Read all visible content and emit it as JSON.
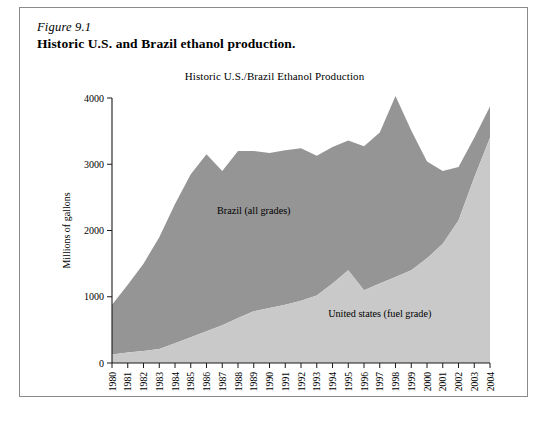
{
  "figure": {
    "number": "Figure 9.1",
    "caption": "Historic U.S. and Brazil ethanol production."
  },
  "chart_data": {
    "type": "area",
    "stacked": true,
    "title": "Historic U.S./Brazil Ethanol Production",
    "xlabel": "",
    "ylabel": "Millions of gallons",
    "ylim": [
      0,
      4000
    ],
    "yticks": [
      0,
      1000,
      2000,
      3000,
      4000
    ],
    "grid": false,
    "legend_position": "inline-annotation",
    "categories": [
      "1980",
      "1981",
      "1982",
      "1983",
      "1984",
      "1985",
      "1986",
      "1987",
      "1988",
      "1989",
      "1990",
      "1991",
      "1992",
      "1993",
      "1994",
      "1995",
      "1996",
      "1997",
      "1998",
      "1999",
      "2000",
      "2001",
      "2002",
      "2003",
      "2004"
    ],
    "series": [
      {
        "name": "United states (fuel grade)",
        "color": "#c9c9c9",
        "values": [
          130,
          160,
          180,
          210,
          300,
          390,
          480,
          570,
          680,
          780,
          830,
          880,
          940,
          1020,
          1200,
          1400,
          1100,
          1200,
          1300,
          1400,
          1580,
          1800,
          2150,
          2800,
          3400
        ]
      },
      {
        "name": "Brazil (all grades)",
        "color": "#959595",
        "values": [
          750,
          1020,
          1320,
          1690,
          2100,
          2460,
          2670,
          2330,
          2520,
          2420,
          2340,
          2330,
          2300,
          2110,
          2060,
          1960,
          2170,
          2280,
          2730,
          2110,
          1460,
          1100,
          810,
          600,
          470
        ]
      }
    ],
    "totals": [
      880,
      1180,
      1500,
      1900,
      2400,
      2850,
      3150,
      2900,
      3200,
      3200,
      3170,
      3210,
      3240,
      3130,
      3260,
      3360,
      3270,
      3480,
      4030,
      3510,
      3040,
      2900,
      2960,
      3400,
      3870
    ],
    "annotations": [
      {
        "text": "Brazil (all grades)",
        "x": "1989",
        "y": 2250
      },
      {
        "text": "United states (fuel grade)",
        "x": "1997",
        "y": 700
      }
    ]
  }
}
